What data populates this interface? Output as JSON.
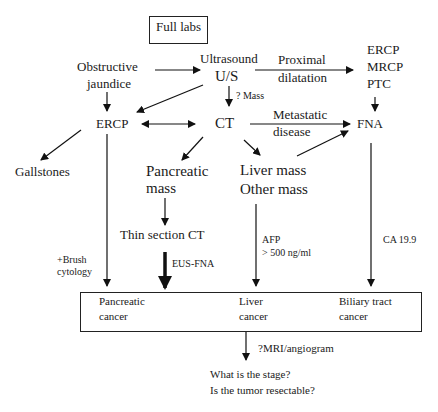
{
  "nodes": {
    "full_labs": "Full labs",
    "obstructive_jaundice": [
      "Obstructive",
      "jaundice"
    ],
    "ultrasound": [
      "Ultrasound",
      "U/S"
    ],
    "ercp_mrcp_ptc": [
      "ERCP",
      "MRCP",
      "PTC"
    ],
    "ercp": "ERCP",
    "ct": "CT",
    "fna": "FNA",
    "gallstones": "Gallstones",
    "pancreatic_mass": [
      "Pancreatic",
      "mass"
    ],
    "liver_other_mass": [
      "Liver mass",
      "Other mass"
    ],
    "thin_section_ct": "Thin section CT",
    "outcome_box": {
      "pancreatic_cancer": [
        "Pancreatic",
        "cancer"
      ],
      "liver_cancer": [
        "Liver",
        "cancer"
      ],
      "biliary_tract_cancer": [
        "Biliary tract",
        "cancer"
      ]
    },
    "final_questions": [
      "What is the stage?",
      "Is the tumor resectable?"
    ]
  },
  "edge_labels": {
    "proximal_dilatation": [
      "Proximal",
      "dilatation"
    ],
    "mass_query": "? Mass",
    "metastatic_disease": [
      "Metastatic",
      "disease"
    ],
    "brush_cytology": [
      "+Brush",
      "cytology"
    ],
    "eus_fna": "EUS-FNA",
    "afp": [
      "AFP",
      "> 500 ng/ml"
    ],
    "ca199": "CA 19.9",
    "mri_angiogram": "?MRI/angiogram"
  }
}
